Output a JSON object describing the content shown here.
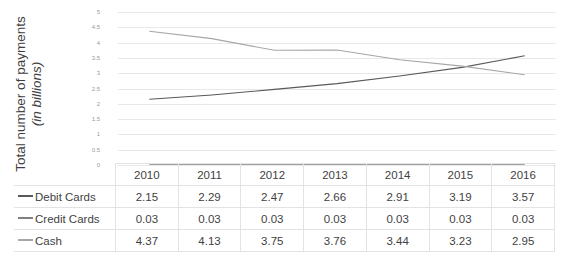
{
  "chart_data": {
    "type": "line",
    "title": "Netherlands",
    "xlabel": "",
    "ylabel_line1": "Total number of payments",
    "ylabel_line2": "(in billions)",
    "categories": [
      "2010",
      "2011",
      "2012",
      "2013",
      "2014",
      "2015",
      "2016"
    ],
    "ylim": [
      0,
      5
    ],
    "yticks": [
      "5",
      "4.5",
      "4",
      "3.5",
      "3",
      "2.5",
      "2",
      "1.5",
      "1",
      "0.5",
      "0"
    ],
    "ytick_values": [
      5,
      4.5,
      4,
      3.5,
      3,
      2.5,
      2,
      1.5,
      1,
      0.5,
      0
    ],
    "grid": true,
    "legend_position": "data-table",
    "series": [
      {
        "name": "Debit Cards",
        "color": "#595959",
        "values": [
          2.15,
          2.29,
          2.47,
          2.66,
          2.91,
          3.19,
          3.57
        ],
        "labels": [
          "2.15",
          "2.29",
          "2.47",
          "2.66",
          "2.91",
          "3.19",
          "3.57"
        ]
      },
      {
        "name": "Credit Cards",
        "color": "#808080",
        "values": [
          0.03,
          0.03,
          0.03,
          0.03,
          0.03,
          0.03,
          0.03
        ],
        "labels": [
          "0.03",
          "0.03",
          "0.03",
          "0.03",
          "0.03",
          "0.03",
          "0.03"
        ]
      },
      {
        "name": "Cash",
        "color": "#a6a6a6",
        "values": [
          4.37,
          4.13,
          3.75,
          3.76,
          3.44,
          3.23,
          2.95
        ],
        "labels": [
          "4.37",
          "4.13",
          "3.75",
          "3.76",
          "3.44",
          "3.23",
          "2.95"
        ]
      }
    ]
  }
}
